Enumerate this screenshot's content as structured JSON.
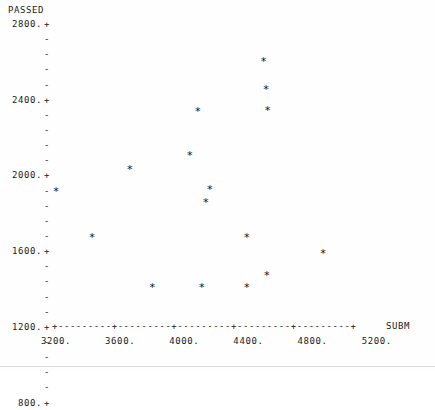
{
  "chart_data": {
    "type": "scatter",
    "title": "",
    "ylabel": "PASSED",
    "xlabel": "SUBM",
    "xlim": [
      3200,
      5200
    ],
    "ylim": [
      800,
      2800
    ],
    "grid": false,
    "legend": null,
    "marker": "*",
    "x_ticks": [
      "3200.",
      "3600.",
      "4000.",
      "4400.",
      "4800.",
      "5200."
    ],
    "x_tick_values": [
      3200,
      3600,
      4000,
      4400,
      4800,
      5200
    ],
    "y_ticks": [
      "2800.",
      "2400.",
      "2000.",
      "1600.",
      "1200.",
      "800."
    ],
    "y_tick_values": [
      2800,
      2400,
      2000,
      1600,
      1200,
      800
    ],
    "minor_ticks_per_interval": 4,
    "axis_line_chars": "+---------+---------+---------+---------+---------+",
    "points": [
      {
        "x": 3200,
        "y": 1680
      },
      {
        "x": 3425,
        "y": 1375
      },
      {
        "x": 3660,
        "y": 1825
      },
      {
        "x": 3800,
        "y": 1045
      },
      {
        "x": 4035,
        "y": 1920
      },
      {
        "x": 4085,
        "y": 2205
      },
      {
        "x": 4110,
        "y": 1045
      },
      {
        "x": 4135,
        "y": 1605
      },
      {
        "x": 4160,
        "y": 1690
      },
      {
        "x": 4390,
        "y": 1375
      },
      {
        "x": 4390,
        "y": 1045
      },
      {
        "x": 4495,
        "y": 2535
      },
      {
        "x": 4510,
        "y": 2355
      },
      {
        "x": 4515,
        "y": 1125
      },
      {
        "x": 4520,
        "y": 2215
      },
      {
        "x": 4865,
        "y": 1270
      }
    ]
  },
  "axis": {
    "y_title": "PASSED",
    "x_title": "SUBM",
    "tick_glyph_major": "+",
    "tick_glyph_minor": "-"
  },
  "colors": {
    "background": "#ffffff",
    "ink": "#1a1a1a",
    "marker": "#111111"
  }
}
